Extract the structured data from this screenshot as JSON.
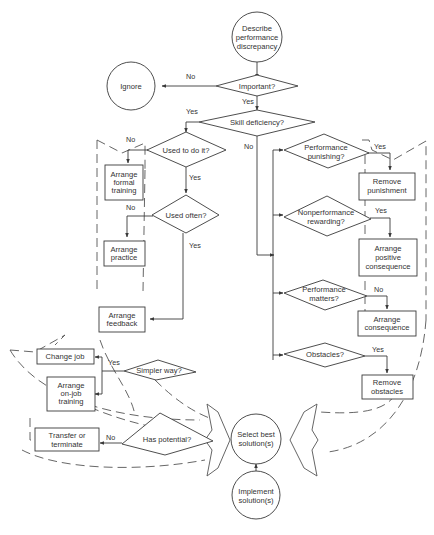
{
  "diagram": {
    "colors": {
      "line": "#3a3a3a",
      "background": "#ffffff",
      "text": "#333333"
    },
    "nodes": {
      "start": {
        "type": "circle",
        "lines": [
          "Describe",
          "performance",
          "discrepancy"
        ]
      },
      "ignore": {
        "type": "circle",
        "lines": [
          "Ignore"
        ]
      },
      "important": {
        "type": "decision",
        "lines": [
          "Important?"
        ]
      },
      "skill_deficiency": {
        "type": "decision",
        "lines": [
          "Skill deficiency?"
        ]
      },
      "used_to_do_it": {
        "type": "decision",
        "lines": [
          "Used to do it?"
        ]
      },
      "arrange_formal_training": {
        "type": "box",
        "lines": [
          "Arrange",
          "formal",
          "training"
        ]
      },
      "used_often": {
        "type": "decision",
        "lines": [
          "Used often?"
        ]
      },
      "arrange_practice": {
        "type": "box",
        "lines": [
          "Arrange",
          "practice"
        ]
      },
      "arrange_feedback": {
        "type": "box",
        "lines": [
          "Arrange",
          "feedback"
        ]
      },
      "performance_punishing": {
        "type": "decision",
        "lines": [
          "Performance",
          "punishing?"
        ]
      },
      "remove_punishment": {
        "type": "box",
        "lines": [
          "Remove",
          "punishment"
        ]
      },
      "nonperformance_rewarding": {
        "type": "decision",
        "lines": [
          "Nonperformance",
          "rewarding?"
        ]
      },
      "arrange_positive_consequence": {
        "type": "box",
        "lines": [
          "Arrange",
          "positive",
          "consequence"
        ]
      },
      "performance_matters": {
        "type": "decision",
        "lines": [
          "Performance",
          "matters?"
        ]
      },
      "arrange_consequence": {
        "type": "box",
        "lines": [
          "Arrange",
          "consequence"
        ]
      },
      "obstacles": {
        "type": "decision",
        "lines": [
          "Obstacles?"
        ]
      },
      "remove_obstacles": {
        "type": "box",
        "lines": [
          "Remove",
          "obstacles"
        ]
      },
      "change_job": {
        "type": "box",
        "lines": [
          "Change job"
        ]
      },
      "arrange_on_job_training": {
        "type": "box",
        "lines": [
          "Arrange",
          "on-job",
          "training"
        ]
      },
      "simpler_way": {
        "type": "decision",
        "lines": [
          "Simpler way?"
        ]
      },
      "transfer_or_terminate": {
        "type": "box",
        "lines": [
          "Transfer or",
          "terminate"
        ]
      },
      "has_potential": {
        "type": "decision",
        "lines": [
          "Has potential?"
        ]
      },
      "select_best_solutions": {
        "type": "circle",
        "lines": [
          "Select best",
          "solution(s)"
        ]
      },
      "implement_solutions": {
        "type": "circle",
        "lines": [
          "Implement",
          "solution(s)"
        ]
      }
    },
    "edge_labels": {
      "important_no": "No",
      "important_yes": "Yes",
      "skill_yes": "Yes",
      "skill_no": "No",
      "used_to_do_it_no": "No",
      "used_to_do_it_yes": "Yes",
      "used_often_no": "No",
      "used_often_yes": "Yes",
      "punishing_yes": "Yes",
      "rewarding_yes": "Yes",
      "matters_no": "No",
      "obstacles_yes": "Yes",
      "simpler_yes": "Yes",
      "potential_no": "No"
    },
    "edges": [
      [
        "start",
        "important"
      ],
      [
        "important",
        "ignore",
        "No"
      ],
      [
        "important",
        "skill_deficiency",
        "Yes"
      ],
      [
        "skill_deficiency",
        "used_to_do_it",
        "Yes"
      ],
      [
        "skill_deficiency",
        "performance_punishing",
        "No"
      ],
      [
        "used_to_do_it",
        "arrange_formal_training",
        "No"
      ],
      [
        "used_to_do_it",
        "used_often",
        "Yes"
      ],
      [
        "used_often",
        "arrange_practice",
        "No"
      ],
      [
        "used_often",
        "arrange_feedback",
        "Yes"
      ],
      [
        "performance_punishing",
        "remove_punishment",
        "Yes"
      ],
      [
        "nonperformance_rewarding",
        "arrange_positive_consequence",
        "Yes"
      ],
      [
        "performance_matters",
        "arrange_consequence",
        "No"
      ],
      [
        "obstacles",
        "remove_obstacles",
        "Yes"
      ],
      [
        "simpler_way",
        "change_job",
        "Yes"
      ],
      [
        "simpler_way",
        "arrange_on_job_training",
        "Yes"
      ],
      [
        "has_potential",
        "transfer_or_terminate",
        "No"
      ],
      [
        "implement_solutions",
        "select_best_solutions"
      ]
    ]
  }
}
